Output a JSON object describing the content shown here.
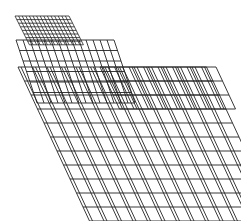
{
  "diagram": {
    "width": 241,
    "height": 221,
    "background": "#ffffff",
    "stroke": "#222222",
    "grids": [
      {
        "name": "large-grid",
        "x": 18,
        "y": 67,
        "cols": 13,
        "rows": 11,
        "cell_w": 14.5,
        "cell_h": 14,
        "shear": 6.5,
        "double_lines": true,
        "stroke_width": 0.9
      },
      {
        "name": "upper-right-grid",
        "x": 100,
        "y": 67,
        "cols": 8,
        "rows": 3,
        "cell_w": 14.5,
        "cell_h": 14,
        "shear": 6.5,
        "double_lines": true,
        "stroke_width": 0.9
      },
      {
        "name": "middle-grid",
        "x": 16,
        "y": 40,
        "cols": 14,
        "rows": 6,
        "cell_w": 7,
        "cell_h": 10.5,
        "shear": 3.5,
        "double_lines": false,
        "stroke_width": 0.9
      },
      {
        "name": "top-dense-grid",
        "x": 15,
        "y": 16,
        "cols": 15,
        "rows": 8,
        "cell_w": 3.6,
        "cell_h": 3.6,
        "shear": 1.8,
        "double_lines": false,
        "stroke_width": 0.8
      }
    ]
  }
}
